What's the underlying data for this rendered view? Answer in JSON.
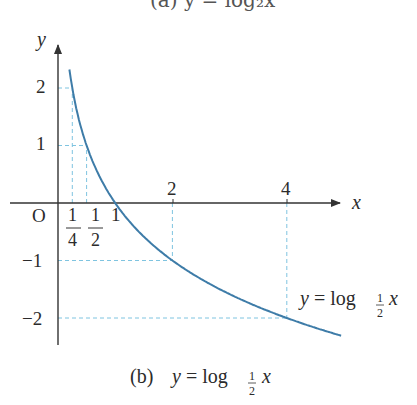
{
  "top_caption": "(a)  y = log₂x",
  "chart_data": {
    "type": "line",
    "xlabel": "x",
    "ylabel": "y",
    "origin_label": "O",
    "x_ticks": [
      {
        "value": 0.25,
        "label": "1/4",
        "num": "1",
        "den": "4"
      },
      {
        "value": 0.5,
        "label": "1/2",
        "num": "1",
        "den": "2"
      },
      {
        "value": 1,
        "label": "1"
      },
      {
        "value": 2,
        "label": "2"
      },
      {
        "value": 4,
        "label": "4"
      }
    ],
    "y_ticks": [
      {
        "value": 2,
        "label": "2"
      },
      {
        "value": 1,
        "label": "1"
      },
      {
        "value": -1,
        "label": "−1"
      },
      {
        "value": -2,
        "label": "−2"
      }
    ],
    "series": [
      {
        "name": "y = log_{1/2} x",
        "function": "log_{1/2}(x)",
        "x": [
          0.2,
          0.25,
          0.5,
          1,
          2,
          4,
          4.95
        ],
        "y": [
          2.32,
          2,
          1,
          0,
          -1,
          -2,
          -2.31
        ]
      }
    ],
    "guide_lines": [
      {
        "x": 0.25,
        "y": 2
      },
      {
        "x": 0.5,
        "y": 1
      },
      {
        "x": 2,
        "y": -1
      },
      {
        "x": 4,
        "y": -2
      }
    ],
    "xlim": [
      0,
      5.1
    ],
    "ylim": [
      -2.4,
      2.7
    ],
    "grid": false,
    "curve_color": "#3e7ca8",
    "guide_color": "#7fc4e0",
    "axis_color": "#333333",
    "curve_label": {
      "prefix": "y = log",
      "base_num": "1",
      "base_den": "2",
      "suffix": "x"
    }
  },
  "caption": {
    "tag": "(b)",
    "prefix": "y = log",
    "base_num": "1",
    "base_den": "2",
    "suffix": "x"
  }
}
